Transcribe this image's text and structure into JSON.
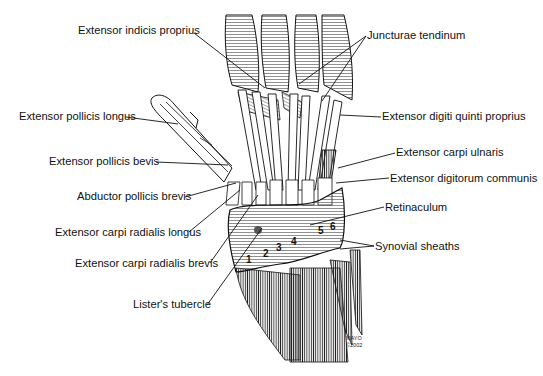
{
  "figure": {
    "background": "#ffffff",
    "ink_color": "#111111"
  },
  "labels": {
    "left": [
      {
        "id": "extensor-indicis-proprius",
        "text": "Extensor indicis proprius",
        "x": 78,
        "y": 25,
        "line_to": [
          265,
          88
        ]
      },
      {
        "id": "extensor-pollicis-longus",
        "text": "Extensor pollicis longus",
        "x": 19,
        "y": 110,
        "line_to": [
          178,
          124
        ]
      },
      {
        "id": "extensor-pollicis-bevis",
        "text": "Extensor pollicis bevis",
        "x": 49,
        "y": 155,
        "line_to": [
          228,
          165
        ]
      },
      {
        "id": "abductor-pollicis-brevis",
        "text": "Abductor pollicis brevis",
        "x": 77,
        "y": 191,
        "line_to": [
          236,
          183
        ]
      },
      {
        "id": "extensor-carpi-radialis-longus",
        "text": "Extensor carpi radialis longus",
        "x": 55,
        "y": 226,
        "line_to": [
          240,
          190
        ]
      },
      {
        "id": "extensor-carpi-radialis-brevis",
        "text": "Extensor carpi radialis brevis",
        "x": 75,
        "y": 257,
        "line_to": [
          258,
          195
        ]
      },
      {
        "id": "listers-tubercle",
        "text": "Lister's tubercle",
        "x": 133,
        "y": 298,
        "line_to": [
          262,
          228
        ]
      }
    ],
    "right": [
      {
        "id": "juncturae-tendinum",
        "text": "Juncturae tendinum",
        "x": 367,
        "y": 34,
        "line_to": [
          [
            299,
            84
          ],
          [
            322,
            101
          ]
        ]
      },
      {
        "id": "extensor-digiti-quinti-proprius",
        "text": "Extensor digiti quinti proprius",
        "x": 382,
        "y": 115,
        "line_to": [
          340,
          115
        ]
      },
      {
        "id": "extensor-carpi-ulnaris",
        "text": "Extensor carpi ulnaris",
        "x": 396,
        "y": 151,
        "line_to": [
          338,
          168
        ]
      },
      {
        "id": "extensor-digitorum-communis",
        "text": "Extensor digitorum communis",
        "x": 390,
        "y": 177,
        "line_to": [
          336,
          183
        ]
      },
      {
        "id": "retinaculum",
        "text": "Retinaculum",
        "x": 385,
        "y": 206,
        "line_to": [
          310,
          225
        ]
      },
      {
        "id": "synovial-sheaths",
        "text": "Synovial sheaths",
        "x": 375,
        "y": 245,
        "line_to": [
          [
            340,
            240
          ],
          [
            340,
            249
          ]
        ]
      }
    ]
  },
  "compartments": [
    "1",
    "2",
    "3",
    "4",
    "5",
    "6"
  ],
  "credit": {
    "line1": "MAYO",
    "line2": "©2002"
  }
}
